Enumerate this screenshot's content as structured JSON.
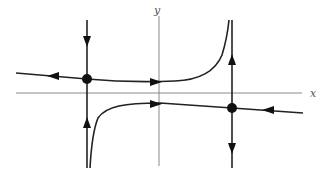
{
  "diagram": {
    "type": "phase-portrait",
    "axes": {
      "x_label": "x",
      "y_label": "y"
    },
    "equilibria": [
      {
        "name": "left-saddle-point",
        "px": [
          87,
          79
        ]
      },
      {
        "name": "right-saddle-point",
        "px": [
          232,
          108
        ]
      }
    ],
    "colors": {
      "axis": "#8a8a8a",
      "curve": "#222222",
      "marker": "#111111"
    }
  }
}
